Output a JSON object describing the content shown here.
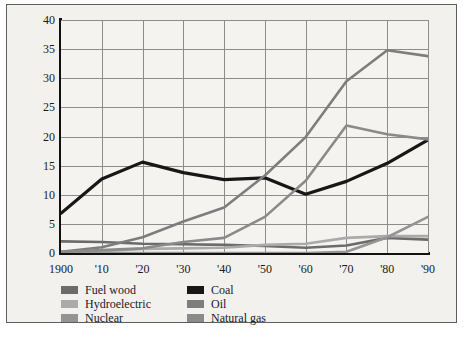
{
  "chart_data": {
    "type": "line",
    "title": "",
    "xlabel": "",
    "ylabel": "Quadrillion Btu",
    "x": [
      1900,
      1910,
      1920,
      1930,
      1940,
      1950,
      1960,
      1970,
      1980,
      1990
    ],
    "xtick_labels": [
      "1900",
      "'10",
      "'20",
      "'30",
      "'40",
      "'50",
      "'60",
      "'70",
      "'80",
      "'90"
    ],
    "ytick_labels": [
      "0",
      "5",
      "10",
      "15",
      "20",
      "25",
      "30",
      "35",
      "40"
    ],
    "ylim": [
      0,
      40
    ],
    "ystep": 5,
    "grid": true,
    "legend_position": "below-axis",
    "series": [
      {
        "name": "Fuel wood",
        "color": "#6b6b6b",
        "values": [
          2.0,
          1.9,
          1.6,
          1.5,
          1.4,
          1.2,
          0.9,
          1.3,
          2.6,
          2.3
        ]
      },
      {
        "name": "Hydroelectric",
        "color": "#aaaaaa",
        "values": [
          0.0,
          0.3,
          0.7,
          0.8,
          0.9,
          1.4,
          1.6,
          2.6,
          2.9,
          2.9
        ]
      },
      {
        "name": "Nuclear",
        "color": "#949494",
        "values": [
          0.0,
          0.0,
          0.0,
          0.0,
          0.0,
          0.0,
          0.0,
          0.2,
          2.7,
          6.2
        ]
      },
      {
        "name": "Coal",
        "color": "#171717",
        "values": [
          6.8,
          12.7,
          15.6,
          13.8,
          12.6,
          12.9,
          10.1,
          12.3,
          15.4,
          19.4
        ]
      },
      {
        "name": "Oil",
        "color": "#7d7d7d",
        "values": [
          0.2,
          1.0,
          2.7,
          5.4,
          7.8,
          13.3,
          19.9,
          29.5,
          34.8,
          33.8
        ]
      },
      {
        "name": "Natural gas",
        "color": "#8a8a8a",
        "values": [
          0.2,
          0.5,
          0.8,
          1.9,
          2.6,
          6.2,
          12.4,
          21.9,
          20.4,
          19.5
        ]
      }
    ]
  },
  "legend": {
    "items": [
      {
        "label": "Fuel wood",
        "color": "#6b6b6b"
      },
      {
        "label": "Coal",
        "color": "#171717"
      },
      {
        "label": "Hydroelectric",
        "color": "#aaaaaa"
      },
      {
        "label": "Oil",
        "color": "#7d7d7d"
      },
      {
        "label": "Nuclear",
        "color": "#949494"
      },
      {
        "label": "Natural gas",
        "color": "#8a8a8a"
      }
    ]
  }
}
